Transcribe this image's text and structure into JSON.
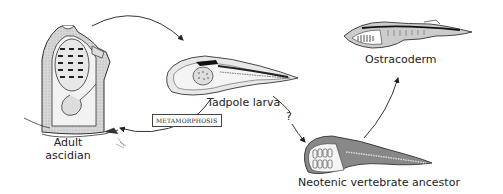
{
  "figure": {
    "nodes": [
      {
        "id": "adult-ascidian",
        "label_line1": "Adult",
        "label_line2": "ascidian"
      },
      {
        "id": "tadpole-larva",
        "label": "Tadpole larva"
      },
      {
        "id": "neotenic-ancestor",
        "label": "Neotenic vertebrate ancestor"
      },
      {
        "id": "ostracoderm",
        "label": "Ostracoderm"
      }
    ],
    "edges": [
      {
        "from": "adult-ascidian",
        "to": "tadpole-larva",
        "label": ""
      },
      {
        "from": "tadpole-larva",
        "to": "adult-ascidian",
        "label": "METAMORPHOSIS"
      },
      {
        "from": "tadpole-larva",
        "to": "neotenic-ancestor",
        "label": "?"
      },
      {
        "from": "neotenic-ancestor",
        "to": "ostracoderm",
        "label": ""
      }
    ],
    "metamorphosis_label": "METAMORPHOSIS",
    "question_mark": "?"
  }
}
